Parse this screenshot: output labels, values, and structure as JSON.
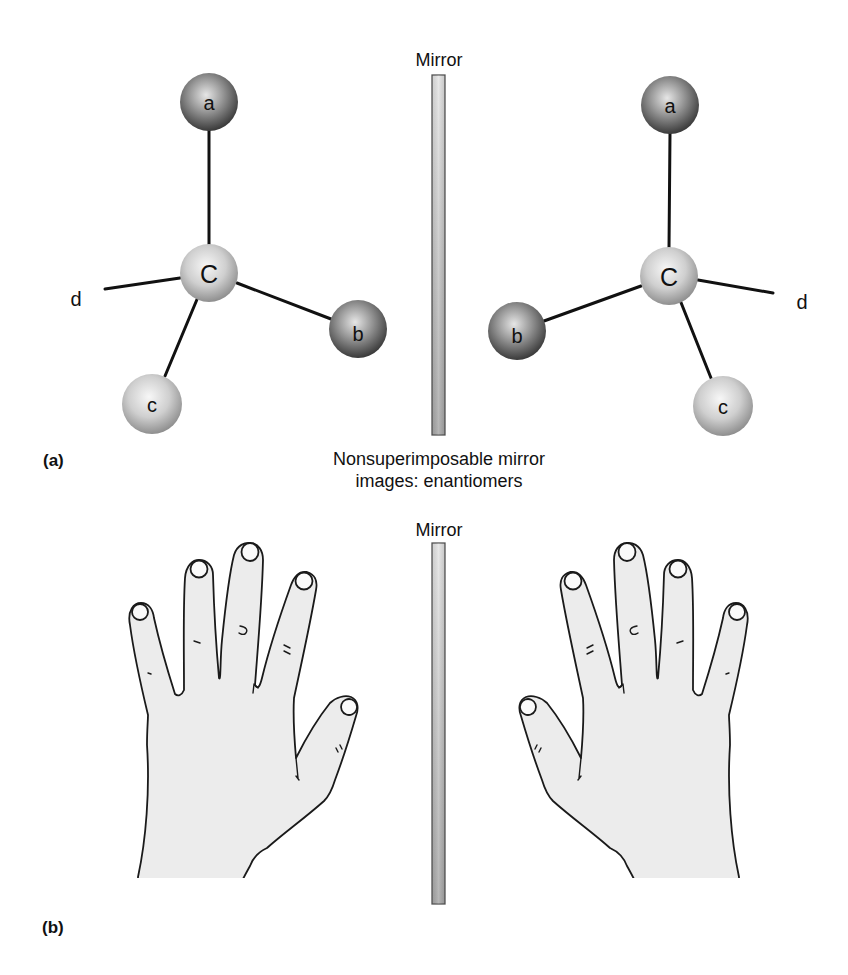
{
  "figure": {
    "panel_a": {
      "label": "(a)",
      "mirror_label": "Mirror",
      "left_molecule": {
        "center": {
          "label": "C",
          "x": 209,
          "y": 273
        },
        "substituents": [
          {
            "id": "a",
            "label": "a",
            "x": 209,
            "y": 102,
            "shade": "dark"
          },
          {
            "id": "b",
            "label": "b",
            "x": 358,
            "y": 329,
            "shade": "dark"
          },
          {
            "id": "c",
            "label": "c",
            "x": 152,
            "y": 404,
            "shade": "light"
          },
          {
            "id": "d",
            "label": "d",
            "bond_end_x": 105,
            "bond_end_y": 289,
            "text_x": 76,
            "text_y": 306
          }
        ]
      },
      "right_molecule": {
        "center": {
          "label": "C",
          "x": 669,
          "y": 276
        },
        "substituents": [
          {
            "id": "a",
            "label": "a",
            "x": 670,
            "y": 105,
            "shade": "dark"
          },
          {
            "id": "b",
            "label": "b",
            "x": 517,
            "y": 331,
            "shade": "dark"
          },
          {
            "id": "c",
            "label": "c",
            "x": 723,
            "y": 406,
            "shade": "light"
          },
          {
            "id": "d",
            "label": "d",
            "bond_end_x": 773,
            "bond_end_y": 293,
            "text_x": 802,
            "text_y": 309
          }
        ]
      }
    },
    "caption": {
      "line1": "Nonsuperimposable mirror",
      "line2": "images: enantiomers"
    },
    "panel_b": {
      "label": "(b)",
      "mirror_label": "Mirror",
      "left_object": "left hand",
      "right_object": "right hand (mirror image)"
    },
    "colors": {
      "dark_sphere_edge": "#3a3a3a",
      "dark_sphere_highlight": "#e6e6e6",
      "light_sphere_edge": "#8f8f8f",
      "light_sphere_highlight": "#f7f7f7",
      "mirror_top": "#e4e4e4",
      "mirror_bottom": "#a8a8a8",
      "skin": "#ececec"
    }
  }
}
